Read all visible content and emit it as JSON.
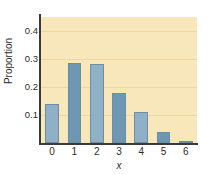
{
  "chart_data": {
    "type": "bar",
    "title": "",
    "xlabel": "x",
    "ylabel": "Proportion",
    "categories": [
      "0",
      "1",
      "2",
      "3",
      "4",
      "5",
      "6"
    ],
    "values": [
      0.14,
      0.285,
      0.283,
      0.18,
      0.11,
      0.04,
      0.008
    ],
    "ylim": [
      0,
      0.45
    ],
    "yticks": [
      0.1,
      0.2,
      0.3,
      0.4
    ],
    "ytick_labels": [
      "0.1",
      "0.2",
      "0.3",
      "0.4"
    ],
    "grid": true,
    "legend": null,
    "colors": {
      "plot_background": "#f8e7ba",
      "gridline": "#edd79f",
      "bar_light": "#8fb0c6",
      "bar_dark": "#6e97b3",
      "bar_edge": "#6b8ea6",
      "axis": "#3a3a3a",
      "text": "#2b2b2b",
      "figure_background": "#ffffff"
    },
    "bar_shades": [
      "light",
      "dark",
      "light",
      "dark",
      "light",
      "dark",
      "light"
    ]
  }
}
